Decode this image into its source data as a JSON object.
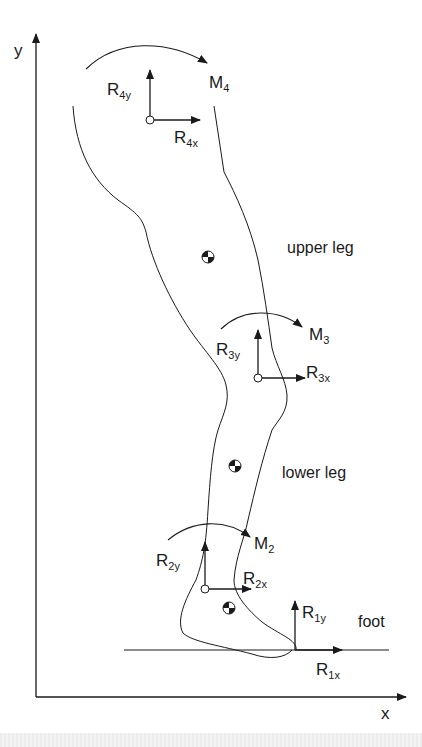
{
  "diagram": {
    "type": "free-body diagram of leg segments",
    "axes": {
      "x_label": "x",
      "y_label": "y"
    },
    "segments": [
      {
        "name": "upper leg",
        "label": "upper leg"
      },
      {
        "name": "lower leg",
        "label": "lower leg"
      },
      {
        "name": "foot",
        "label": "foot"
      }
    ],
    "joints": [
      {
        "id": 4,
        "moment": {
          "base": "M",
          "sub": "4"
        },
        "rx": {
          "base": "R",
          "sub": "4x"
        },
        "ry": {
          "base": "R",
          "sub": "4y"
        }
      },
      {
        "id": 3,
        "moment": {
          "base": "M",
          "sub": "3"
        },
        "rx": {
          "base": "R",
          "sub": "3x"
        },
        "ry": {
          "base": "R",
          "sub": "3y"
        }
      },
      {
        "id": 2,
        "moment": {
          "base": "M",
          "sub": "2"
        },
        "rx": {
          "base": "R",
          "sub": "2x"
        },
        "ry": {
          "base": "R",
          "sub": "2y"
        }
      },
      {
        "id": 1,
        "rx": {
          "base": "R",
          "sub": "1x"
        },
        "ry": {
          "base": "R",
          "sub": "1y"
        }
      }
    ],
    "center_of_mass_markers": 3,
    "colors": {
      "ink": "#1a1a1a",
      "background": "#ffffff",
      "band": "#ececec"
    }
  }
}
